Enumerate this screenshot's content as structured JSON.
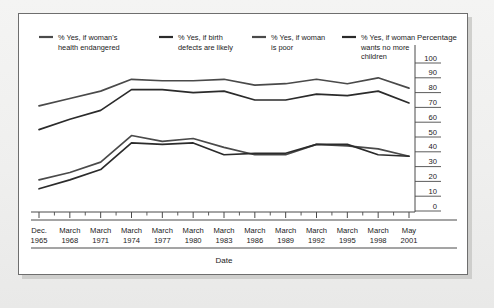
{
  "panel": {
    "background": "#ffffff",
    "border_color": "#6e6e6e"
  },
  "chart_data": {
    "type": "line",
    "title": "",
    "xlabel": "Date",
    "ylabel": "Percentage",
    "ylim": [
      0,
      100
    ],
    "ytick_step": 10,
    "yticks": [
      "0",
      "10",
      "20",
      "30",
      "40",
      "50",
      "60",
      "70",
      "80",
      "90",
      "100"
    ],
    "grid": false,
    "legend_position": "top",
    "categories": [
      "Dec. 1965",
      "March 1968",
      "March 1971",
      "March 1974",
      "March 1977",
      "March 1980",
      "March 1983",
      "March 1986",
      "March 1989",
      "March 1992",
      "March 1995",
      "March 1998",
      "May 2001"
    ],
    "tick_labels_line1": [
      "Dec.",
      "March",
      "March",
      "March",
      "March",
      "March",
      "March",
      "March",
      "March",
      "March",
      "March",
      "March",
      "May"
    ],
    "tick_labels_line2": [
      "1965",
      "1968",
      "1971",
      "1974",
      "1977",
      "1980",
      "1983",
      "1986",
      "1989",
      "1992",
      "1995",
      "1998",
      "2001"
    ],
    "x": [
      1965,
      1968,
      1971,
      1974,
      1977,
      1980,
      1983,
      1986,
      1989,
      1992,
      1995,
      1998,
      2001
    ],
    "series": [
      {
        "name": "% Yes, if woman's health endangered",
        "label_line1": "% Yes, if woman's",
        "label_line2": "health endangered",
        "color": "#4a4a4a",
        "values": [
          71,
          76,
          81,
          89,
          88,
          88,
          89,
          85,
          86,
          89,
          86,
          90,
          83
        ]
      },
      {
        "name": "% Yes, if birth defects are likely",
        "label_line1": "% Yes, if birth",
        "label_line2": "defects are likely",
        "color": "#2b2b2b",
        "values": [
          55,
          62,
          68,
          82,
          82,
          80,
          81,
          75,
          75,
          79,
          78,
          81,
          73
        ]
      },
      {
        "name": "% Yes, if woman is poor",
        "label_line1": "% Yes, if woman",
        "label_line2": "is poor",
        "color": "#4a4a4a",
        "values": [
          21,
          26,
          33,
          51,
          47,
          49,
          43,
          38,
          38,
          45,
          44,
          42,
          37
        ]
      },
      {
        "name": "% Yes, if woman wants no more children",
        "label_line1": "% Yes, if woman",
        "label_line2": "wants no more",
        "label_line3": "children",
        "color": "#2b2b2b",
        "values": [
          15,
          21,
          28,
          46,
          45,
          46,
          38,
          39,
          39,
          45,
          45,
          38,
          37
        ]
      }
    ]
  }
}
